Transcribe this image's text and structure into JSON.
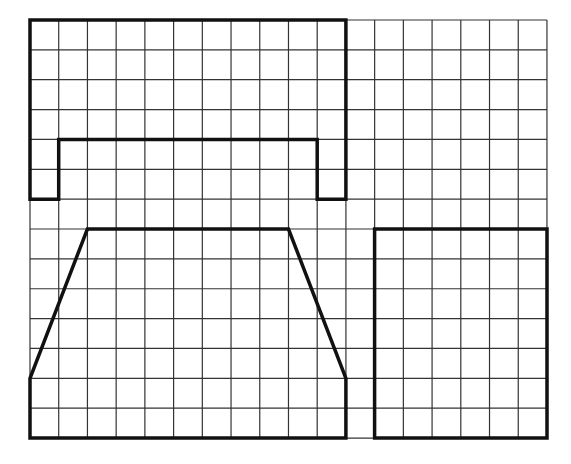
{
  "grid": {
    "origin_px": [
      30,
      20
    ],
    "cell_w_px": 28.72,
    "cell_h_px": 29.86,
    "cols": 18,
    "rows": 14,
    "line_color": "#333333"
  },
  "shapes": [
    {
      "name": "u-shape",
      "description": "Rectangle with a notch cut out of the bottom (upside-down U)",
      "stroke_color": "#111111",
      "points": [
        [
          0,
          0
        ],
        [
          11,
          0
        ],
        [
          11,
          6
        ],
        [
          10,
          6
        ],
        [
          10,
          4
        ],
        [
          1,
          4
        ],
        [
          1,
          6
        ],
        [
          0,
          6
        ]
      ]
    },
    {
      "name": "trapezoid-shape",
      "description": "Hexagon: trapezoid top with vertical sides at bottom",
      "stroke_color": "#111111",
      "points": [
        [
          2,
          7
        ],
        [
          9,
          7
        ],
        [
          11,
          12
        ],
        [
          11,
          14
        ],
        [
          0,
          14
        ],
        [
          0,
          12
        ]
      ]
    },
    {
      "name": "rectangle-shape",
      "description": "Rectangle 6 columns by 7 rows",
      "stroke_color": "#111111",
      "points": [
        [
          12,
          7
        ],
        [
          18,
          7
        ],
        [
          18,
          14
        ],
        [
          12,
          14
        ]
      ]
    }
  ]
}
